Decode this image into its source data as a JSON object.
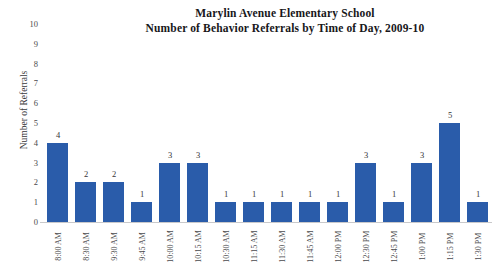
{
  "chart_data": {
    "type": "bar",
    "title": "Marylin Avenue Elementary School\nNumber of Behavior Referrals by Time of Day, 2009-10",
    "title_line1": "Marylin Avenue Elementary School",
    "title_line2": "Number of Behavior Referrals by Time of Day, 2009-10",
    "xlabel": "",
    "ylabel": "Number of Referrals",
    "ylim": [
      0,
      10
    ],
    "ytick_labels": [
      "10",
      "9",
      "8",
      "7",
      "6",
      "5",
      "4",
      "3",
      "2",
      "1",
      "0"
    ],
    "ytick_values": [
      10,
      9,
      8,
      7,
      6,
      5,
      4,
      3,
      2,
      1,
      0
    ],
    "grid": false,
    "legend": false,
    "bar_color": "#2a5caa",
    "categories": [
      "8:00 AM",
      "8:30 AM",
      "9:30 AM",
      "9:45 AM",
      "10:00 AM",
      "10:15 AM",
      "10:30 AM",
      "11:15 AM",
      "11:30 AM",
      "11:45 AM",
      "12:00 PM",
      "12:30 PM",
      "12:45 PM",
      "1:00 PM",
      "1:15 PM",
      "1:30 PM"
    ],
    "values": [
      4,
      2,
      2,
      1,
      3,
      3,
      1,
      1,
      1,
      1,
      1,
      3,
      1,
      3,
      5,
      1
    ],
    "data_labels": [
      "4",
      "2",
      "2",
      "1",
      "3",
      "3",
      "1",
      "1",
      "1",
      "1",
      "1",
      "3",
      "1",
      "3",
      "5",
      "1"
    ]
  }
}
